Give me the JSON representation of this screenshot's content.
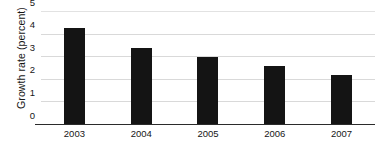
{
  "chart_data": {
    "type": "bar",
    "title": "",
    "xlabel": "",
    "ylabel": "Growth rate (percent)",
    "categories": [
      "2003",
      "2004",
      "2005",
      "2006",
      "2007"
    ],
    "values": [
      4.3,
      3.4,
      3.0,
      2.6,
      2.2
    ],
    "ylim": [
      0,
      5
    ],
    "yticks": [
      "0",
      "1",
      "2",
      "3",
      "4",
      "5"
    ],
    "ytick_values": [
      0,
      1,
      2,
      3,
      4,
      5
    ],
    "grid": true,
    "legend": "none",
    "bar_color": "#141414",
    "gridline_color": "#d9d9d9",
    "axis_color": "#2b2b2b",
    "background_color": "#ffffff"
  }
}
